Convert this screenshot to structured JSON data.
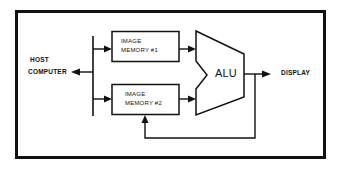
{
  "diagram": {
    "host": {
      "line1": "HOST",
      "line2": "COMPUTER"
    },
    "memory1": {
      "line1": "IMAGE",
      "line2": "MEMORY #1"
    },
    "memory2": {
      "line1": "IMAGE",
      "line2": "MEMORY #2"
    },
    "alu": {
      "label": "ALU"
    },
    "display": {
      "label": "DISPLAY"
    }
  }
}
